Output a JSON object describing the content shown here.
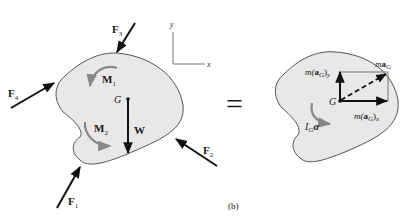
{
  "diagram": {
    "caption": "(b)",
    "equals_sign": "=",
    "colors": {
      "body_fill": "#e8e8e8",
      "body_stroke": "#555555",
      "force_arrow": "#111111",
      "moment_arrow": "#888888",
      "text": "#1a1a1a"
    },
    "axes": {
      "x_label": "x",
      "y_label": "y"
    },
    "free_body": {
      "center_label": "G",
      "weight_label": "W",
      "forces": [
        {
          "id": "F1",
          "main": "F",
          "sub": "1"
        },
        {
          "id": "F2",
          "main": "F",
          "sub": "2"
        },
        {
          "id": "F3",
          "main": "F",
          "sub": "3"
        },
        {
          "id": "F4",
          "main": "F",
          "sub": "4"
        }
      ],
      "moments": [
        {
          "id": "M1",
          "main": "M",
          "sub": "1"
        },
        {
          "id": "M2",
          "main": "M",
          "sub": "2"
        }
      ]
    },
    "kinetic": {
      "center_label": "G",
      "may": {
        "prefix": "m(",
        "bold": "a",
        "sub": "G",
        "close": ")",
        "axis": "y"
      },
      "max": {
        "prefix": "m(",
        "bold": "a",
        "sub": "G",
        "close": ")",
        "axis": "x"
      },
      "mag": {
        "prefix": "m",
        "bold": "a",
        "sub": "G"
      },
      "inertia": {
        "main": "I",
        "sub": "G",
        "greek": "α"
      }
    }
  }
}
